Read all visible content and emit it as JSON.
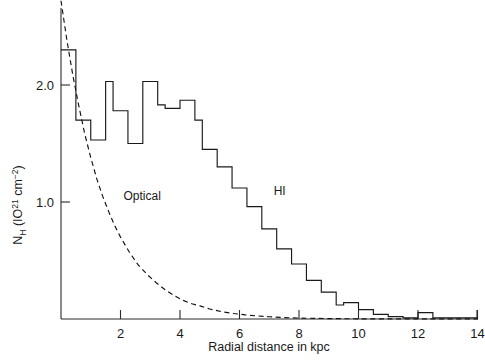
{
  "chart_data": {
    "type": "line",
    "title": "",
    "xlabel": "Radial distance in kpc",
    "ylabel": "N_H (IO^21 cm^-2)",
    "ylabel_parts": {
      "symbol": "N",
      "subscript": "H",
      "open": " (IO",
      "exponent": "21",
      "unit": " cm",
      "unit_exponent": "−2",
      "close": ")"
    },
    "xlim": [
      0,
      14.5
    ],
    "ylim": [
      0,
      2.72
    ],
    "grid": false,
    "legend_position": "inline-annotations",
    "xticks": [
      2,
      4,
      6,
      8,
      10,
      12,
      14
    ],
    "xtick_labels": [
      "2",
      "4",
      "6",
      "8",
      "10",
      "12",
      "14"
    ],
    "yticks": [
      1.0,
      2.0
    ],
    "ytick_labels": [
      "1.0",
      "2.0"
    ],
    "annotations": [
      {
        "label": "Optical",
        "x": 2.1,
        "y": 1.02
      },
      {
        "label": "HI",
        "x": 7.15,
        "y": 1.06
      }
    ],
    "series": [
      {
        "name": "HI",
        "type": "step-histogram",
        "style": "solid",
        "color": "#000000",
        "bin_edges": [
          0.0,
          0.25,
          0.5,
          0.75,
          1.0,
          1.25,
          1.5,
          1.75,
          2.0,
          2.25,
          2.5,
          2.75,
          3.0,
          3.25,
          3.5,
          3.75,
          4.0,
          4.25,
          4.5,
          4.75,
          5.0,
          5.25,
          5.5,
          5.75,
          6.0,
          6.25,
          6.5,
          6.75,
          7.0,
          7.25,
          7.5,
          7.75,
          8.0,
          8.25,
          8.5,
          8.75,
          9.0,
          9.25,
          9.5,
          9.75,
          10.0,
          10.25,
          10.5,
          10.75,
          11.0,
          11.25,
          11.5,
          11.75,
          12.0,
          12.25,
          12.5,
          14.5
        ],
        "values": [
          2.3,
          2.3,
          1.7,
          1.7,
          1.53,
          1.53,
          2.03,
          1.78,
          1.78,
          1.5,
          1.5,
          2.03,
          2.03,
          1.83,
          1.8,
          1.8,
          1.87,
          1.87,
          1.7,
          1.45,
          1.45,
          1.3,
          1.3,
          1.12,
          1.12,
          0.96,
          0.96,
          0.77,
          0.77,
          0.6,
          0.6,
          0.47,
          0.47,
          0.33,
          0.33,
          0.23,
          0.23,
          0.12,
          0.14,
          0.14,
          0.08,
          0.08,
          0.04,
          0.04,
          0.02,
          0.02,
          0.01,
          0.01,
          0.055,
          0.055,
          0.01,
          0.01
        ]
      },
      {
        "name": "Optical",
        "type": "exponential-decay",
        "style": "dashed",
        "color": "#000000",
        "amplitude": 2.72,
        "scale_length_kpc": 1.45,
        "x": [
          0.0,
          0.2,
          0.4,
          0.6,
          0.8,
          1.0,
          1.2,
          1.4,
          1.6,
          1.8,
          2.0,
          2.3,
          2.6,
          2.9,
          3.2,
          3.5,
          3.8,
          4.1,
          4.4,
          4.7,
          5.0,
          5.4,
          5.8,
          6.2,
          6.6,
          7.0,
          7.5,
          8.0,
          8.6,
          9.2,
          10.0,
          11.0,
          12.0,
          13.0,
          14.3
        ],
        "y": [
          2.72,
          2.38,
          2.08,
          1.82,
          1.58,
          1.38,
          1.2,
          1.05,
          0.92,
          0.8,
          0.7,
          0.57,
          0.46,
          0.38,
          0.31,
          0.25,
          0.2,
          0.16,
          0.13,
          0.11,
          0.085,
          0.063,
          0.047,
          0.035,
          0.026,
          0.019,
          0.012,
          0.008,
          0.005,
          0.003,
          0.0015,
          0.001,
          0.0008,
          0.0006,
          0.0005
        ]
      }
    ]
  }
}
